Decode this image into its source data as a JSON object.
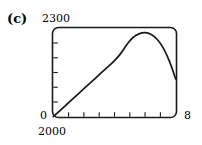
{
  "figure": {
    "panel_label": "(c)",
    "background_color": "#ffffff",
    "stroke_color": "#1a1a1a"
  },
  "axes": {
    "y_max_label": "2300",
    "y_min_label": "2000",
    "y_origin_label": "0",
    "x_max_label": "8",
    "y_tick_count": 5,
    "x_tick_count": 7
  },
  "chart_data": {
    "type": "line",
    "title": "(c)",
    "xlabel": "",
    "ylabel": "",
    "xlim": [
      0,
      8
    ],
    "ylim": [
      2000,
      2300
    ],
    "grid": false,
    "legend": null,
    "series": [
      {
        "name": "curve",
        "x": [
          0,
          0.4,
          0.8,
          1.2,
          1.6,
          2.0,
          2.4,
          2.8,
          3.2,
          3.6,
          4.0,
          4.4,
          4.8,
          5.2,
          5.6,
          6.0,
          6.4,
          6.8,
          7.2,
          7.6,
          8.0
        ],
        "y": [
          2000,
          2019,
          2038,
          2057,
          2076,
          2095,
          2114,
          2133,
          2152,
          2171,
          2190,
          2214,
          2244,
          2268,
          2281,
          2285,
          2279,
          2262,
          2232,
          2187,
          2128
        ]
      }
    ],
    "annotations": [
      {
        "text": "2300",
        "position": "y-axis-top"
      },
      {
        "text": "2000",
        "position": "y-axis-bottom"
      },
      {
        "text": "0",
        "position": "origin"
      },
      {
        "text": "8",
        "position": "x-axis-right"
      }
    ]
  }
}
